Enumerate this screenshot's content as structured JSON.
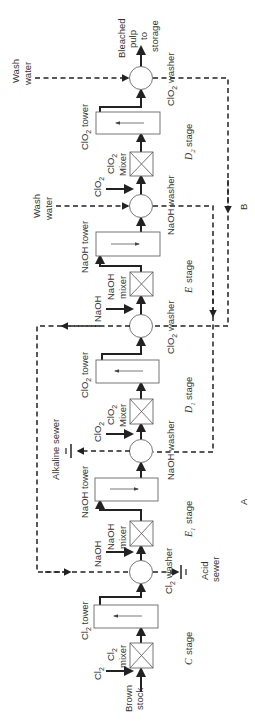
{
  "diagram": {
    "orientation": "rotated 90 degrees (reads bottom to top)",
    "inputs": {
      "brown_stock": [
        "Brown",
        "stock"
      ],
      "cl2": "Cl2",
      "wash_water_e": [
        "Wash",
        "water"
      ],
      "wash_water_d2": [
        "Wash",
        "water"
      ]
    },
    "output": [
      "Bleached",
      "pulp",
      "to",
      "storage"
    ],
    "stages": [
      {
        "id": "C",
        "letter": "C",
        "sub": "",
        "word": "stage",
        "mixer": [
          "Cl2",
          "mixer"
        ],
        "tower": "Cl2 tower",
        "washer": "Cl2 washer",
        "chemical": "Cl2",
        "tower_flow": "down"
      },
      {
        "id": "E1",
        "letter": "E",
        "sub": "1",
        "word": "stage",
        "mixer": [
          "NaOH",
          "mixer"
        ],
        "tower": "NaOH tower",
        "washer": "NaOH washer",
        "chemical": "NaOH",
        "tower_flow": "up"
      },
      {
        "id": "D1",
        "letter": "D",
        "sub": "1",
        "word": "stage",
        "mixer": [
          "ClO2",
          "Mixer"
        ],
        "tower": "ClO2 tower",
        "washer": "ClO2 washer",
        "chemical": "ClO2",
        "tower_flow": "down"
      },
      {
        "id": "E",
        "letter": "E",
        "sub": "",
        "word": "stage",
        "mixer": [
          "NaOH",
          "mixer"
        ],
        "tower": "NaOH tower",
        "washer": "NaOH washer",
        "chemical": "NaOH",
        "tower_flow": "up"
      },
      {
        "id": "D2",
        "letter": "D",
        "sub": "2",
        "word": "stage",
        "mixer": [
          "ClO2",
          "Mixer"
        ],
        "tower": "ClO2 tower",
        "washer": "ClO2 washer",
        "chemical": "ClO2",
        "tower_flow": "down"
      }
    ],
    "sewers": {
      "acid": [
        "Acid",
        "sewer"
      ],
      "alkaline": "Alkaline sewer"
    },
    "loop_labels": {
      "A": "A",
      "B": "B"
    },
    "colors": {
      "line": "#222222",
      "box_outline": "#666666",
      "text": "#333333",
      "background": "#ffffff"
    }
  }
}
